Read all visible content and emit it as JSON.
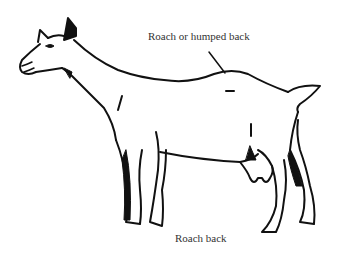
{
  "figure": {
    "labels": {
      "top": "Roach or humped back",
      "bottom": "Roach back"
    }
  }
}
